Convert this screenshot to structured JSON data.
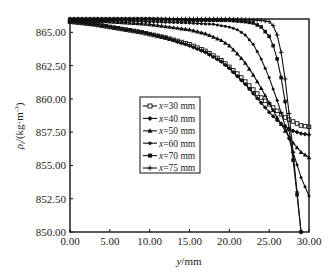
{
  "chart_data": {
    "type": "line",
    "title": "",
    "xlabel": "y/mm",
    "xlabel_var": "y",
    "xlabel_unit": "/mm",
    "ylabel": "ρl/(kg·m⁻³)",
    "xlim": [
      0,
      30
    ],
    "ylim": [
      850,
      866
    ],
    "xticks": [
      0,
      5,
      10,
      15,
      20,
      25,
      30
    ],
    "xtick_labels": [
      "0.00",
      "5.00",
      "10.00",
      "15.00",
      "20.00",
      "25.00",
      "30.00"
    ],
    "yticks": [
      850,
      852.5,
      855,
      857.5,
      860,
      862.5,
      865
    ],
    "ytick_labels": [
      "850.00",
      "852.50",
      "855.00",
      "857.50",
      "860.00",
      "862.50",
      "865.00"
    ],
    "grid": false,
    "legend_position": "center",
    "series": [
      {
        "name": "x=30 mm",
        "var": "x",
        "label_rest": "=30 mm",
        "marker": "square",
        "x": [
          0,
          3,
          6,
          9,
          12,
          15,
          17,
          19,
          20,
          21,
          22,
          23,
          24,
          25,
          26,
          27,
          28,
          29,
          30
        ],
        "values": [
          865.8,
          865.6,
          865.3,
          865.0,
          864.6,
          864.1,
          863.6,
          862.9,
          862.4,
          861.9,
          861.3,
          860.7,
          860.1,
          859.6,
          859.1,
          858.6,
          858.3,
          858.0,
          857.9
        ]
      },
      {
        "name": "x=40 mm",
        "var": "x",
        "label_rest": "=40 mm",
        "marker": "diamond",
        "x": [
          0,
          3,
          6,
          9,
          12,
          15,
          17,
          19,
          20,
          21,
          22,
          23,
          24,
          25,
          26,
          27,
          28,
          29,
          30
        ],
        "values": [
          865.8,
          865.6,
          865.3,
          865.0,
          864.6,
          864.0,
          863.5,
          862.8,
          862.3,
          861.7,
          861.1,
          860.4,
          859.7,
          859.0,
          858.4,
          857.9,
          857.6,
          857.4,
          857.3
        ]
      },
      {
        "name": "x=50 mm",
        "var": "x",
        "label_rest": "=50 mm",
        "marker": "triangle",
        "x": [
          0,
          5,
          10,
          15,
          17,
          19,
          20,
          21,
          22,
          23,
          24,
          25,
          26,
          27,
          28,
          29,
          30
        ],
        "values": [
          865.9,
          865.8,
          865.6,
          865.2,
          864.9,
          864.4,
          864.0,
          863.4,
          862.7,
          861.8,
          860.8,
          859.7,
          858.6,
          857.6,
          856.7,
          856.0,
          855.6
        ]
      },
      {
        "name": "x=60 mm",
        "var": "x",
        "label_rest": "=60 mm",
        "marker": "circle",
        "x": [
          0,
          5,
          10,
          15,
          18,
          20,
          21,
          22,
          23,
          24,
          25,
          26,
          27,
          28,
          29,
          30
        ],
        "values": [
          865.9,
          865.9,
          865.8,
          865.7,
          865.6,
          865.4,
          865.2,
          864.8,
          864.1,
          863.0,
          861.6,
          859.9,
          858.0,
          856.0,
          854.1,
          852.7
        ]
      },
      {
        "name": "x=70 mm",
        "var": "x",
        "label_rest": "=70 mm",
        "marker": "filled-square",
        "x": [
          0,
          5,
          10,
          15,
          20,
          22,
          23,
          24,
          25,
          25.5,
          26,
          26.5,
          27,
          27.5,
          28,
          28.5,
          29
        ],
        "values": [
          866.0,
          866.0,
          866.0,
          865.9,
          865.9,
          865.8,
          865.7,
          865.4,
          864.7,
          864.0,
          863.0,
          861.6,
          859.8,
          857.7,
          855.4,
          852.8,
          850.0
        ]
      },
      {
        "name": "x=75 mm",
        "var": "x",
        "label_rest": "=75 mm",
        "marker": "plus",
        "x": [
          0,
          5,
          10,
          15,
          20,
          24,
          25,
          25.5,
          26,
          26.5,
          27,
          27.5,
          28,
          28.5,
          29
        ],
        "values": [
          866.0,
          866.0,
          866.0,
          866.0,
          866.0,
          865.9,
          865.8,
          865.5,
          864.8,
          863.5,
          861.5,
          858.9,
          856.0,
          853.0,
          850.0
        ]
      }
    ]
  }
}
